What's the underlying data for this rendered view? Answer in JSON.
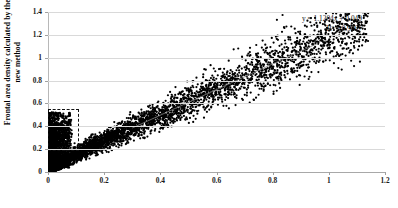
{
  "chart_data": {
    "type": "scatter",
    "title": "",
    "xlabel": "Frontal area density calculated by the traditional method",
    "ylabel_line1": "Frontal area density calculated by the",
    "ylabel_line2": "new method",
    "xlim": [
      0,
      1.2
    ],
    "ylim": [
      0,
      1.4
    ],
    "xticks": [
      "0",
      "0.2",
      "0.4",
      "0.6",
      "0.8",
      "1",
      "1.2"
    ],
    "xtick_values": [
      0,
      0.2,
      0.4,
      0.6,
      0.8,
      1.0,
      1.2
    ],
    "yticks": [
      "0",
      "0.2",
      "0.4",
      "0.6",
      "0.8",
      "1",
      "1.2",
      "1.4"
    ],
    "ytick_values": [
      0,
      0.2,
      0.4,
      0.6,
      0.8,
      1.0,
      1.2,
      1.4
    ],
    "grid": "horizontal",
    "legend": "none",
    "marker_color": "#000000",
    "marker_size": 1.1,
    "n_points": 5200,
    "trendline": {
      "slope": 1.1204,
      "intercept": 0.049,
      "r_squared": 0.9007,
      "equation_text": "y = 1.1204x + 0.049",
      "r2_text": "R² = 0.9007",
      "color": "#808080",
      "x_start": 0.3,
      "x_end": 0.96
    },
    "annotations": [
      {
        "name": "outlier-cluster-highlight",
        "shape": "dashed-rectangle",
        "x0": 0.0,
        "x1": 0.105,
        "y0": 0.205,
        "y1": 0.555,
        "color": "#111111"
      }
    ],
    "series": [
      {
        "name": "Frontal area density comparison",
        "description": "Dense diagonal band of points following y = 1.1204x + 0.049 with a vertical cluster of scatter near x = 0.",
        "x_range": [
          0.0,
          1.12
        ],
        "y_range": [
          0.0,
          1.22
        ]
      }
    ]
  }
}
